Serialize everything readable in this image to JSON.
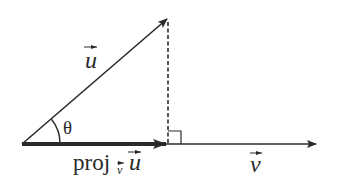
{
  "diagram": {
    "colors": {
      "stroke": "#2a2a2a",
      "background": "#ffffff"
    },
    "labels": {
      "u_vector": "u",
      "v_vector": "v",
      "angle": "θ",
      "proj_prefix": "proj",
      "proj_sub": "v",
      "proj_arg": "u"
    },
    "elements": [
      {
        "name": "vector-u",
        "kind": "arrow",
        "label": "u"
      },
      {
        "name": "vector-v",
        "kind": "arrow",
        "label": "v"
      },
      {
        "name": "projection-vector",
        "kind": "thick-arrow",
        "label": "proj_v u"
      },
      {
        "name": "perpendicular-drop",
        "kind": "dashed-line"
      },
      {
        "name": "right-angle-marker",
        "kind": "square-marker"
      },
      {
        "name": "angle-arc",
        "kind": "arc",
        "label": "θ"
      }
    ]
  }
}
